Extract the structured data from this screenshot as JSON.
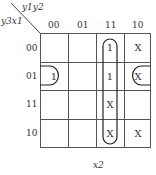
{
  "corner": {
    "top_label": "y1y2",
    "left_label": "y3x1"
  },
  "column_headers": [
    "00",
    "01",
    "11",
    "10"
  ],
  "row_headers": [
    "00",
    "01",
    "11",
    "10"
  ],
  "cells": [
    [
      "",
      "",
      "1",
      "X"
    ],
    [
      "1",
      "",
      "1",
      "X"
    ],
    [
      "",
      "",
      "X",
      ""
    ],
    [
      "",
      "",
      "X",
      "X"
    ]
  ],
  "groups": [
    {
      "name": "column-11-group",
      "cells": "col 11, rows 00-10"
    },
    {
      "name": "wrap-row-01-group",
      "cells": "row 01, cols 00 and 10"
    }
  ],
  "bottom_label": "x2"
}
